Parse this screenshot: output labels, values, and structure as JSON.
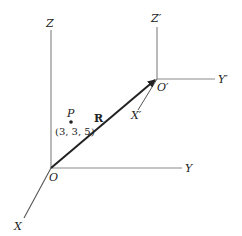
{
  "diagram": {
    "title": "",
    "frames": {
      "original": {
        "origin_label": "O",
        "axes": {
          "x": "X",
          "y": "Y",
          "z": "Z"
        }
      },
      "translated": {
        "origin_label": "O′",
        "axes": {
          "x": "X′",
          "y": "Y′",
          "z": "Z′"
        }
      }
    },
    "vector": {
      "label": "R",
      "from": "O",
      "to": "O′"
    },
    "point": {
      "label": "P",
      "coordinates": "(3, 3, 5)"
    },
    "colors": {
      "axis": "#888888",
      "vector": "#222222",
      "text": "#222222"
    }
  }
}
